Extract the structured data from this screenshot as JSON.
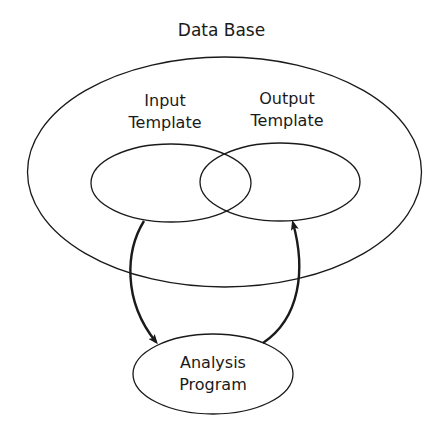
{
  "diagram": {
    "title": "Data Base",
    "nodes": {
      "database": {
        "label": "Data Base"
      },
      "input_template": {
        "line1": "Input",
        "line2": "Template"
      },
      "output_template": {
        "line1": "Output",
        "line2": "Template"
      },
      "analysis_program": {
        "line1": "Analysis",
        "line2": "Program"
      }
    },
    "edges": [
      {
        "from": "Input Template",
        "to": "Analysis Program"
      },
      {
        "from": "Analysis Program",
        "to": "Output Template"
      }
    ],
    "colors": {
      "stroke": "#1a1a1a",
      "background": "#ffffff"
    }
  }
}
